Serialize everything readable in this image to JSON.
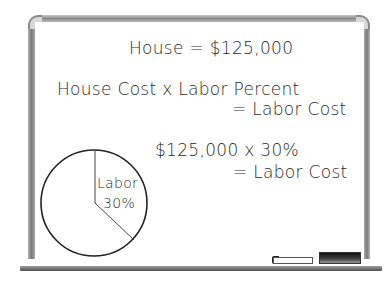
{
  "whiteboard": {
    "line1": "House = $125,000",
    "line2a": "House Cost x Labor Percent",
    "line2b": "= Labor Cost",
    "line3a": "$125,000 x 30%",
    "line3b": "= Labor Cost"
  },
  "pie": {
    "label": "Labor",
    "value": "30%",
    "slices": [
      {
        "name": "Labor",
        "percent": 30
      },
      {
        "name": "Other",
        "percent": 70
      }
    ]
  },
  "tray_items": [
    "marker",
    "eraser"
  ]
}
